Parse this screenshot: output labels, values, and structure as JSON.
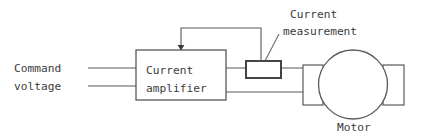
{
  "diagram": {
    "type": "block-diagram",
    "canvas": {
      "width": 422,
      "height": 139,
      "background": "#ffffff"
    },
    "colors": {
      "wire": "#58585a",
      "box_border": "#4a4a4c",
      "sensor_border": "#3c3c3e",
      "motor_border": "#5a5a5c",
      "text": "#3b3b3d",
      "arrow": "#3a3a3c"
    },
    "labels": {
      "command_voltage_line1": "Command",
      "command_voltage_line2": "voltage",
      "amplifier_line1": "Current",
      "amplifier_line2": "amplifier",
      "measurement_line1": "Current",
      "measurement_line2": "measurement",
      "motor": "Motor"
    },
    "blocks": [
      {
        "name": "current-amplifier",
        "label": "Current amplifier",
        "x": 136,
        "y": 50,
        "width": 90,
        "height": 50
      },
      {
        "name": "current-measurement-sensor",
        "label": "Current measurement",
        "x": 246,
        "y": 61,
        "width": 35,
        "height": 17
      },
      {
        "name": "motor-terminal-block",
        "label": "",
        "x": 303,
        "y": 65,
        "width": 20,
        "height": 40
      },
      {
        "name": "motor-shaft-block",
        "label": "",
        "x": 383,
        "y": 65,
        "width": 21,
        "height": 40
      }
    ],
    "motor": {
      "name": "motor-body",
      "cx": 353,
      "cy": 84.5,
      "r": 34.5
    },
    "signals": [
      {
        "name": "command-voltage-upper",
        "from_x": 88,
        "to_x": 136,
        "y": 68
      },
      {
        "name": "command-voltage-lower",
        "from_x": 88,
        "to_x": 136,
        "y": 86
      },
      {
        "name": "amplifier-output-upper",
        "from_x": 226,
        "to_x": 303,
        "y": 68
      },
      {
        "name": "amplifier-output-lower",
        "from_x": 226,
        "to_x": 303,
        "y": 92
      }
    ],
    "feedback": {
      "name": "current-feedback-path",
      "description": "Measured current routed back to the current amplifier input",
      "from_x": 261,
      "from_y": 61,
      "top_y": 28,
      "to_x": 181,
      "to_y": 50
    },
    "leader": {
      "name": "measurement-leader-line",
      "x1": 279,
      "y1": 34,
      "x2": 265,
      "y2": 61
    }
  }
}
